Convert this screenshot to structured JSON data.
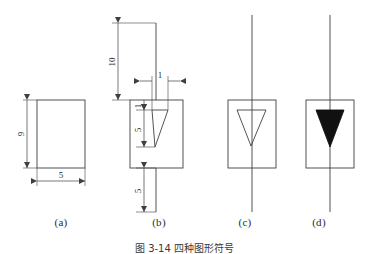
{
  "figure": {
    "caption": "图 3-14  四种图形符号",
    "background_color": "#ffffff",
    "line_color": "#3f3f3f",
    "fill_color": "#111111"
  },
  "panels": [
    {
      "id": "a",
      "caption": "(a)",
      "description": "plain-rectangle-with-dimensions",
      "dimensions": [
        {
          "name": "height",
          "value": "9",
          "orientation": "vertical",
          "side": "left"
        },
        {
          "name": "width",
          "value": "5",
          "orientation": "horizontal",
          "side": "bottom"
        }
      ]
    },
    {
      "id": "b",
      "caption": "(b)",
      "description": "rectangle-with-wedge-and-lead-dimensions",
      "dimensions": [
        {
          "name": "top-lead-length",
          "value": "10",
          "orientation": "vertical",
          "side": "left"
        },
        {
          "name": "wedge-top-width",
          "value": "1",
          "orientation": "horizontal",
          "side": "top"
        },
        {
          "name": "wedge-offset",
          "value": "1",
          "orientation": "vertical",
          "side": "inner-left"
        },
        {
          "name": "wedge-height",
          "value": "5",
          "orientation": "vertical",
          "side": "inner-left"
        },
        {
          "name": "bottom-lead-length",
          "value": "5",
          "orientation": "vertical",
          "side": "left"
        }
      ]
    },
    {
      "id": "c",
      "caption": "(c)",
      "description": "rectangle-with-hollow-triangle-and-vertical-lead",
      "triangle_fill": "none",
      "dimensions": []
    },
    {
      "id": "d",
      "caption": "(d)",
      "description": "rectangle-with-filled-triangle-and-vertical-lead",
      "triangle_fill": "#111111",
      "dimensions": []
    }
  ],
  "labels": {
    "a_height": "9",
    "a_width": "5",
    "b_top_lead": "10",
    "b_wedge_top": "1",
    "b_wedge_offset": "1",
    "b_wedge_height": "5",
    "b_bottom_lead": "5"
  }
}
